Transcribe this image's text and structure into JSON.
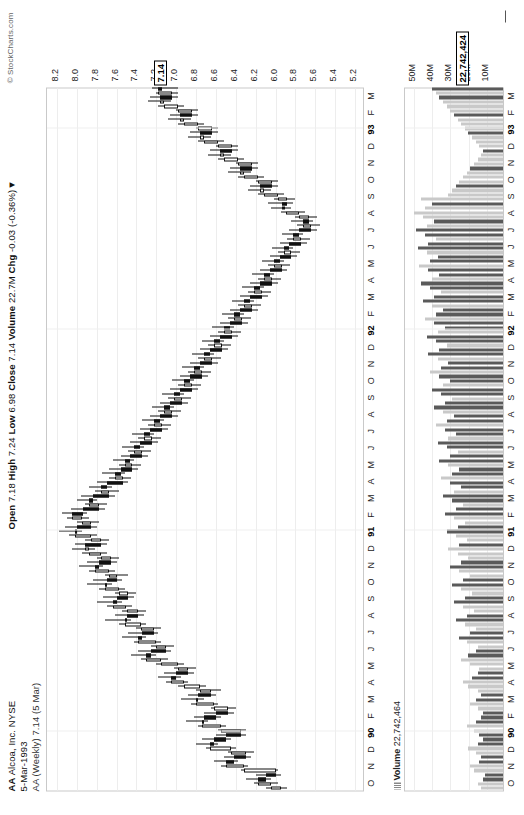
{
  "meta": {
    "symbol": "AA",
    "company": "Alcoa, Inc. NYSE",
    "date": "5-Mar-1993",
    "series_label": "AA (Weekly) 7.14 (5 Mar)",
    "copyright": "© StockCharts.com"
  },
  "quote": {
    "open_label": "Open",
    "open": "7.18",
    "high_label": "High",
    "high": "7.24",
    "low_label": "Low",
    "low": "6.98",
    "close_label": "Close",
    "close": "7.14",
    "volume_label": "Volume",
    "volume": "22.7M",
    "chg_label": "Chg",
    "chg": "-0.03 (-0.36%)",
    "chg_arrow": "▼"
  },
  "annotation": {
    "line1": "Messy Chart! No clear direction of movement or",
    "line2": "trend or consolidation! Wait for better set ups!",
    "line3": "Most people are not patient enough to wait for",
    "line4": "the right set ups."
  },
  "volume_footer": {
    "icon": "volume-bars-icon",
    "label": "Volume",
    "value": "22,742,464"
  },
  "price_last_box": "7.14",
  "volume_last_box": "22,742,424",
  "chart_data": {
    "type": "candlestick",
    "xlabel": "",
    "ylabel": "Price",
    "ylim": [
      5.1,
      8.3
    ],
    "yticks": [
      "8.2",
      "8.0",
      "7.8",
      "7.6",
      "7.4",
      "7.2",
      "7.0",
      "6.8",
      "6.6",
      "6.4",
      "6.2",
      "6.0",
      "5.8",
      "5.6",
      "5.4",
      "5.2"
    ],
    "grid": true,
    "legend": "none",
    "xticks": [
      "O",
      "N",
      "D",
      "90",
      "F",
      "M",
      "A",
      "M",
      "J",
      "J",
      "A",
      "S",
      "O",
      "N",
      "D",
      "91",
      "F",
      "M",
      "A",
      "M",
      "J",
      "J",
      "A",
      "S",
      "O",
      "N",
      "D",
      "92",
      "F",
      "M",
      "A",
      "M",
      "J",
      "J",
      "A",
      "S",
      "O",
      "N",
      "D",
      "93",
      "F",
      "M"
    ],
    "volume": {
      "type": "bar",
      "ylim": [
        0,
        55
      ],
      "yticks": [
        "50M",
        "40M",
        "30M",
        "20M",
        "10M"
      ],
      "unit": "M"
    },
    "note": "Weekly OHLC candles, Oct-1989 through Mar-1993; last close 7.14, last volume 22,742,464",
    "ohlc": [
      [
        5.95,
        6.1,
        5.88,
        6.05
      ],
      [
        6.05,
        6.22,
        5.98,
        6.18
      ],
      [
        6.18,
        6.3,
        6.05,
        6.1
      ],
      [
        6.1,
        6.2,
        5.95,
        6.0
      ],
      [
        6.0,
        6.35,
        5.98,
        6.32
      ],
      [
        6.32,
        6.55,
        6.28,
        6.5
      ],
      [
        6.5,
        6.62,
        6.38,
        6.42
      ],
      [
        6.42,
        6.52,
        6.25,
        6.3
      ],
      [
        6.3,
        6.48,
        6.22,
        6.45
      ],
      [
        6.45,
        6.7,
        6.4,
        6.66
      ],
      [
        6.66,
        6.8,
        6.58,
        6.62
      ],
      [
        6.62,
        6.74,
        6.45,
        6.5
      ],
      [
        6.5,
        6.6,
        6.3,
        6.35
      ],
      [
        6.35,
        6.58,
        6.3,
        6.55
      ],
      [
        6.55,
        6.78,
        6.5,
        6.74
      ],
      [
        6.74,
        6.9,
        6.68,
        6.72
      ],
      [
        6.72,
        6.82,
        6.55,
        6.6
      ],
      [
        6.6,
        6.72,
        6.42,
        6.48
      ],
      [
        6.48,
        6.65,
        6.4,
        6.62
      ],
      [
        6.62,
        6.85,
        6.58,
        6.8
      ],
      [
        6.8,
        6.95,
        6.72,
        6.78
      ],
      [
        6.78,
        6.88,
        6.6,
        6.65
      ],
      [
        6.65,
        6.8,
        6.55,
        6.76
      ],
      [
        6.76,
        6.98,
        6.7,
        6.92
      ],
      [
        6.92,
        7.1,
        6.88,
        7.05
      ],
      [
        7.05,
        7.18,
        6.95,
        7.0
      ],
      [
        7.0,
        7.12,
        6.82,
        6.88
      ],
      [
        6.88,
        7.02,
        6.8,
        6.98
      ],
      [
        6.98,
        7.2,
        6.92,
        7.15
      ],
      [
        7.15,
        7.35,
        7.08,
        7.3
      ],
      [
        7.3,
        7.45,
        7.2,
        7.25
      ],
      [
        7.25,
        7.38,
        7.05,
        7.1
      ],
      [
        7.1,
        7.25,
        7.02,
        7.2
      ],
      [
        7.2,
        7.42,
        7.15,
        7.38
      ],
      [
        7.38,
        7.55,
        7.3,
        7.34
      ],
      [
        7.34,
        7.48,
        7.18,
        7.22
      ],
      [
        7.22,
        7.4,
        7.15,
        7.35
      ],
      [
        7.35,
        7.58,
        7.3,
        7.52
      ],
      [
        7.52,
        7.72,
        7.45,
        7.5
      ],
      [
        7.5,
        7.62,
        7.32,
        7.38
      ],
      [
        7.38,
        7.55,
        7.3,
        7.5
      ],
      [
        7.5,
        7.7,
        7.44,
        7.64
      ],
      [
        7.64,
        7.8,
        7.55,
        7.6
      ],
      [
        7.6,
        7.74,
        7.42,
        7.48
      ],
      [
        7.48,
        7.62,
        7.4,
        7.58
      ],
      [
        7.58,
        7.78,
        7.52,
        7.72
      ],
      [
        7.72,
        7.9,
        7.65,
        7.7
      ],
      [
        7.7,
        7.84,
        7.55,
        7.6
      ],
      [
        7.6,
        7.72,
        7.48,
        7.68
      ],
      [
        7.68,
        7.88,
        7.62,
        7.82
      ],
      [
        7.82,
        7.98,
        7.74,
        7.78
      ],
      [
        7.78,
        7.9,
        7.6,
        7.66
      ],
      [
        7.66,
        7.8,
        7.58,
        7.76
      ],
      [
        7.76,
        7.95,
        7.7,
        7.88
      ],
      [
        7.88,
        8.05,
        7.82,
        7.92
      ],
      [
        7.92,
        8.02,
        7.7,
        7.76
      ],
      [
        7.76,
        7.92,
        7.68,
        7.86
      ],
      [
        7.86,
        8.08,
        7.8,
        8.02
      ],
      [
        8.02,
        8.18,
        7.95,
        8.0
      ],
      [
        8.0,
        8.12,
        7.8,
        7.86
      ],
      [
        7.86,
        8.0,
        7.78,
        7.95
      ],
      [
        7.95,
        8.1,
        7.88,
        8.05
      ],
      [
        8.05,
        8.15,
        7.9,
        7.94
      ],
      [
        7.94,
        8.06,
        7.72,
        7.78
      ],
      [
        7.78,
        7.92,
        7.7,
        7.88
      ],
      [
        7.88,
        8.0,
        7.8,
        7.84
      ],
      [
        7.84,
        7.96,
        7.62,
        7.68
      ],
      [
        7.68,
        7.82,
        7.58,
        7.76
      ],
      [
        7.76,
        7.88,
        7.65,
        7.7
      ],
      [
        7.7,
        7.8,
        7.48,
        7.54
      ],
      [
        7.54,
        7.68,
        7.45,
        7.62
      ],
      [
        7.62,
        7.75,
        7.52,
        7.56
      ],
      [
        7.56,
        7.68,
        7.38,
        7.44
      ],
      [
        7.44,
        7.58,
        7.35,
        7.52
      ],
      [
        7.52,
        7.64,
        7.42,
        7.46
      ],
      [
        7.46,
        7.56,
        7.28,
        7.34
      ],
      [
        7.34,
        7.48,
        7.25,
        7.42
      ],
      [
        7.42,
        7.55,
        7.32,
        7.36
      ],
      [
        7.36,
        7.46,
        7.18,
        7.24
      ],
      [
        7.24,
        7.38,
        7.15,
        7.32
      ],
      [
        7.32,
        7.44,
        7.22,
        7.26
      ],
      [
        7.26,
        7.36,
        7.08,
        7.14
      ],
      [
        7.14,
        7.28,
        7.05,
        7.22
      ],
      [
        7.22,
        7.34,
        7.12,
        7.16
      ],
      [
        7.16,
        7.26,
        6.98,
        7.04
      ],
      [
        7.04,
        7.18,
        6.95,
        7.12
      ],
      [
        7.12,
        7.24,
        7.02,
        7.06
      ],
      [
        7.06,
        7.16,
        6.88,
        6.94
      ],
      [
        6.94,
        7.08,
        6.85,
        7.02
      ],
      [
        7.02,
        7.14,
        6.92,
        6.96
      ],
      [
        6.96,
        7.06,
        6.78,
        6.84
      ],
      [
        6.84,
        6.98,
        6.75,
        6.92
      ],
      [
        6.92,
        7.04,
        6.82,
        6.86
      ],
      [
        6.86,
        6.96,
        6.68,
        6.74
      ],
      [
        6.74,
        6.88,
        6.65,
        6.82
      ],
      [
        6.82,
        6.94,
        6.72,
        6.76
      ],
      [
        6.76,
        6.86,
        6.58,
        6.64
      ],
      [
        6.64,
        6.78,
        6.55,
        6.72
      ],
      [
        6.72,
        6.84,
        6.62,
        6.66
      ],
      [
        6.66,
        6.76,
        6.48,
        6.54
      ],
      [
        6.54,
        6.68,
        6.45,
        6.62
      ],
      [
        6.62,
        6.74,
        6.52,
        6.56
      ],
      [
        6.56,
        6.66,
        6.38,
        6.44
      ],
      [
        6.44,
        6.58,
        6.35,
        6.52
      ],
      [
        6.52,
        6.64,
        6.42,
        6.46
      ],
      [
        6.46,
        6.56,
        6.28,
        6.34
      ],
      [
        6.34,
        6.48,
        6.25,
        6.42
      ],
      [
        6.42,
        6.54,
        6.32,
        6.36
      ],
      [
        6.36,
        6.46,
        6.18,
        6.24
      ],
      [
        6.24,
        6.38,
        6.15,
        6.32
      ],
      [
        6.32,
        6.44,
        6.22,
        6.26
      ],
      [
        6.26,
        6.36,
        6.08,
        6.14
      ],
      [
        6.14,
        6.28,
        6.05,
        6.22
      ],
      [
        6.22,
        6.34,
        6.12,
        6.16
      ],
      [
        6.16,
        6.26,
        5.98,
        6.04
      ],
      [
        6.04,
        6.18,
        5.95,
        6.12
      ],
      [
        6.12,
        6.24,
        6.02,
        6.06
      ],
      [
        6.06,
        6.16,
        5.88,
        5.94
      ],
      [
        5.94,
        6.08,
        5.85,
        6.02
      ],
      [
        6.02,
        6.14,
        5.92,
        5.96
      ],
      [
        5.96,
        6.06,
        5.78,
        5.84
      ],
      [
        5.84,
        5.98,
        5.75,
        5.92
      ],
      [
        5.92,
        6.04,
        5.82,
        5.86
      ],
      [
        5.86,
        5.96,
        5.68,
        5.74
      ],
      [
        5.74,
        5.88,
        5.65,
        5.82
      ],
      [
        5.82,
        5.94,
        5.72,
        5.76
      ],
      [
        5.76,
        5.86,
        5.58,
        5.64
      ],
      [
        5.64,
        5.78,
        5.55,
        5.72
      ],
      [
        5.72,
        5.84,
        5.62,
        5.66
      ],
      [
        5.66,
        5.8,
        5.58,
        5.76
      ],
      [
        5.76,
        5.95,
        5.7,
        5.9
      ],
      [
        5.9,
        6.05,
        5.84,
        5.94
      ],
      [
        5.94,
        6.08,
        5.82,
        5.88
      ],
      [
        5.88,
        6.02,
        5.8,
        5.98
      ],
      [
        5.98,
        6.18,
        5.92,
        6.12
      ],
      [
        6.12,
        6.28,
        6.05,
        6.16
      ],
      [
        6.16,
        6.26,
        5.98,
        6.04
      ],
      [
        6.04,
        6.2,
        5.98,
        6.18
      ],
      [
        6.18,
        6.38,
        6.12,
        6.32
      ],
      [
        6.32,
        6.48,
        6.25,
        6.36
      ],
      [
        6.36,
        6.46,
        6.18,
        6.24
      ],
      [
        6.24,
        6.4,
        6.18,
        6.38
      ],
      [
        6.38,
        6.58,
        6.32,
        6.52
      ],
      [
        6.52,
        6.68,
        6.45,
        6.56
      ],
      [
        6.56,
        6.66,
        6.38,
        6.44
      ],
      [
        6.44,
        6.6,
        6.38,
        6.58
      ],
      [
        6.58,
        6.78,
        6.52,
        6.72
      ],
      [
        6.72,
        6.88,
        6.65,
        6.76
      ],
      [
        6.76,
        6.86,
        6.58,
        6.64
      ],
      [
        6.64,
        6.8,
        6.58,
        6.78
      ],
      [
        6.78,
        6.98,
        6.72,
        6.92
      ],
      [
        6.92,
        7.08,
        6.85,
        6.96
      ],
      [
        6.96,
        7.06,
        6.78,
        6.84
      ],
      [
        6.84,
        7.0,
        6.78,
        6.98
      ],
      [
        6.98,
        7.18,
        6.92,
        7.12
      ],
      [
        7.12,
        7.28,
        7.05,
        7.16
      ],
      [
        7.16,
        7.26,
        6.98,
        7.04
      ],
      [
        7.04,
        7.2,
        6.98,
        7.18
      ],
      [
        7.18,
        7.24,
        6.98,
        7.14
      ]
    ],
    "volumes": [
      12,
      14,
      11,
      10,
      16,
      18,
      13,
      12,
      15,
      19,
      14,
      11,
      13,
      16,
      20,
      15,
      12,
      11,
      14,
      18,
      15,
      12,
      14,
      19,
      22,
      17,
      14,
      13,
      18,
      23,
      19,
      15,
      14,
      20,
      24,
      18,
      15,
      21,
      26,
      20,
      16,
      22,
      27,
      21,
      17,
      23,
      28,
      22,
      18,
      24,
      29,
      23,
      19,
      25,
      30,
      24,
      20,
      26,
      31,
      25,
      21,
      27,
      32,
      26,
      22,
      28,
      33,
      27,
      23,
      29,
      34,
      28,
      24,
      30,
      35,
      29,
      25,
      31,
      36,
      30,
      26,
      32,
      37,
      31,
      27,
      33,
      38,
      32,
      28,
      34,
      39,
      33,
      29,
      35,
      40,
      34,
      30,
      36,
      41,
      35,
      31,
      37,
      42,
      36,
      32,
      38,
      43,
      37,
      33,
      39,
      44,
      38,
      34,
      40,
      45,
      39,
      35,
      41,
      46,
      40,
      36,
      42,
      47,
      41,
      37,
      43,
      48,
      42,
      38,
      44,
      49,
      43,
      39,
      45,
      30,
      28,
      26,
      24,
      22,
      20,
      18,
      16,
      14,
      12,
      11,
      13,
      15,
      17,
      19,
      21,
      23,
      25,
      27,
      29,
      31,
      33,
      35,
      37,
      39,
      41,
      23
    ]
  }
}
